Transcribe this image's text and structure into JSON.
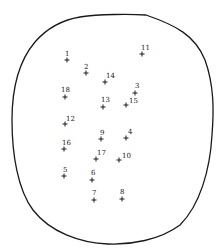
{
  "diagram": {
    "outline": {
      "stroke": "#1a1a1a",
      "path": "M 80 17 C 100 14, 130 14, 146 15 C 175 25, 195 35, 205 60 C 214 85, 214 110, 212 135 C 210 170, 200 205, 180 225 C 160 240, 130 245, 108 244 C 80 243, 50 232, 33 210 C 18 190, 12 155, 12 120 C 12 90, 18 62, 35 42 C 48 27, 62 20, 80 17 Z"
    },
    "points": [
      {
        "label": "1",
        "x": 67,
        "y": 60,
        "lx": 65,
        "ly": 56
      },
      {
        "label": "2",
        "x": 86,
        "y": 73,
        "lx": 84,
        "ly": 69
      },
      {
        "label": "3",
        "x": 135,
        "y": 93,
        "lx": 135,
        "ly": 88
      },
      {
        "label": "4",
        "x": 126,
        "y": 138,
        "lx": 128,
        "ly": 134
      },
      {
        "label": "5",
        "x": 64,
        "y": 176,
        "lx": 63,
        "ly": 172
      },
      {
        "label": "6",
        "x": 92,
        "y": 180,
        "lx": 91,
        "ly": 175
      },
      {
        "label": "7",
        "x": 94,
        "y": 200,
        "lx": 92,
        "ly": 195
      },
      {
        "label": "8",
        "x": 122,
        "y": 199,
        "lx": 120,
        "ly": 194
      },
      {
        "label": "9",
        "x": 101,
        "y": 139,
        "lx": 100,
        "ly": 135
      },
      {
        "label": "10",
        "x": 119,
        "y": 160,
        "lx": 122,
        "ly": 158
      },
      {
        "label": "11",
        "x": 142,
        "y": 54,
        "lx": 141,
        "ly": 50
      },
      {
        "label": "12",
        "x": 65,
        "y": 124,
        "lx": 66,
        "ly": 121
      },
      {
        "label": "13",
        "x": 103,
        "y": 107,
        "lx": 101,
        "ly": 102
      },
      {
        "label": "14",
        "x": 105,
        "y": 82,
        "lx": 106,
        "ly": 78
      },
      {
        "label": "15",
        "x": 126,
        "y": 105,
        "lx": 129,
        "ly": 103
      },
      {
        "label": "16",
        "x": 64,
        "y": 149,
        "lx": 62,
        "ly": 145
      },
      {
        "label": "17",
        "x": 96,
        "y": 159,
        "lx": 97,
        "ly": 155
      },
      {
        "label": "18",
        "x": 65,
        "y": 97,
        "lx": 61,
        "ly": 92
      }
    ]
  }
}
